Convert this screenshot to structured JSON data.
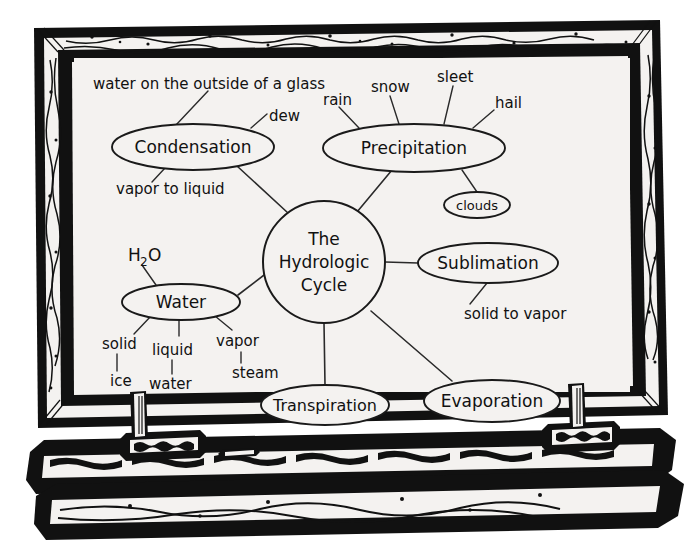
{
  "scene": {
    "kind": "chalkboard-concept-map",
    "page_background": "#ffffff",
    "board_surface": "#f4f2f0",
    "frame_color": "#111111",
    "ink_color": "#111111"
  },
  "board": {
    "ledge_items": [
      {
        "name": "eraser-left",
        "label": ""
      },
      {
        "name": "chalk-stick",
        "label": ""
      },
      {
        "name": "eraser-right",
        "label": ""
      }
    ]
  },
  "map": {
    "center": {
      "id": "hydrologic-cycle",
      "lines": [
        "The",
        "Hydrologic",
        "Cycle"
      ],
      "text": "The Hydrologic Cycle",
      "cx": 324,
      "cy": 262,
      "r": 61
    },
    "nodes": [
      {
        "id": "condensation",
        "label": "Condensation",
        "cx": 193,
        "cy": 147,
        "rx": 81,
        "ry": 23,
        "font": 17
      },
      {
        "id": "precipitation",
        "label": "Precipitation",
        "cx": 414,
        "cy": 148,
        "rx": 91,
        "ry": 24,
        "font": 17
      },
      {
        "id": "clouds",
        "label": "clouds",
        "cx": 477,
        "cy": 205,
        "rx": 33,
        "ry": 13,
        "font": 13
      },
      {
        "id": "water",
        "label": "Water",
        "cx": 181,
        "cy": 302,
        "rx": 59,
        "ry": 18,
        "font": 17
      },
      {
        "id": "sublimation",
        "label": "Sublimation",
        "cx": 488,
        "cy": 263,
        "rx": 70,
        "ry": 20,
        "font": 17
      },
      {
        "id": "transpiration",
        "label": "Transpiration",
        "cx": 325,
        "cy": 405,
        "rx": 64,
        "ry": 20,
        "font": 16
      },
      {
        "id": "evaporation",
        "label": "Evaporation",
        "cx": 492,
        "cy": 401,
        "rx": 68,
        "ry": 21,
        "font": 17
      }
    ],
    "free_labels": [
      {
        "id": "water-outside-glass",
        "text": "water on the outside of a glass",
        "x": 93,
        "y": 84,
        "font": 15,
        "anchor": "start"
      },
      {
        "id": "dew",
        "text": "dew",
        "x": 269,
        "y": 116,
        "font": 15,
        "anchor": "start"
      },
      {
        "id": "rain",
        "text": "rain",
        "x": 323,
        "y": 100,
        "font": 15,
        "anchor": "start"
      },
      {
        "id": "snow",
        "text": "snow",
        "x": 371,
        "y": 87,
        "font": 15,
        "anchor": "start"
      },
      {
        "id": "sleet",
        "text": "sleet",
        "x": 437,
        "y": 77,
        "font": 15,
        "anchor": "start"
      },
      {
        "id": "hail",
        "text": "hail",
        "x": 495,
        "y": 103,
        "font": 15,
        "anchor": "start"
      },
      {
        "id": "vapor-to-liquid",
        "text": "vapor to liquid",
        "x": 116,
        "y": 189,
        "font": 15,
        "anchor": "start"
      },
      {
        "id": "solid-to-vapor",
        "text": "solid to vapor",
        "x": 464,
        "y": 314,
        "font": 15,
        "anchor": "start"
      },
      {
        "id": "solid",
        "text": "solid",
        "x": 102,
        "y": 344,
        "font": 15,
        "anchor": "start"
      },
      {
        "id": "liquid",
        "text": "liquid",
        "x": 152,
        "y": 350,
        "font": 15,
        "anchor": "start"
      },
      {
        "id": "vapor",
        "text": "vapor",
        "x": 216,
        "y": 341,
        "font": 15,
        "anchor": "start"
      },
      {
        "id": "ice",
        "text": "ice",
        "x": 110,
        "y": 381,
        "font": 15,
        "anchor": "start"
      },
      {
        "id": "water-state",
        "text": "water",
        "x": 149,
        "y": 384,
        "font": 15,
        "anchor": "start"
      },
      {
        "id": "steam",
        "text": "steam",
        "x": 232,
        "y": 373,
        "font": 15,
        "anchor": "start"
      }
    ],
    "formula": {
      "id": "h2o",
      "base": "H",
      "sub": "2",
      "tail": "O",
      "x": 128,
      "y": 256,
      "font": 17
    },
    "edges": [
      {
        "from": "condensation",
        "to": "hydrologic-cycle"
      },
      {
        "from": "precipitation",
        "to": "hydrologic-cycle"
      },
      {
        "from": "water",
        "to": "hydrologic-cycle"
      },
      {
        "from": "sublimation",
        "to": "hydrologic-cycle"
      },
      {
        "from": "transpiration",
        "to": "hydrologic-cycle"
      },
      {
        "from": "evaporation",
        "to": "hydrologic-cycle"
      },
      {
        "from": "precipitation",
        "to": "clouds"
      },
      {
        "from": "condensation",
        "to": "water-outside-glass"
      },
      {
        "from": "condensation",
        "to": "dew"
      },
      {
        "from": "condensation",
        "to": "vapor-to-liquid"
      },
      {
        "from": "precipitation",
        "to": "rain"
      },
      {
        "from": "precipitation",
        "to": "snow"
      },
      {
        "from": "precipitation",
        "to": "sleet"
      },
      {
        "from": "precipitation",
        "to": "hail"
      },
      {
        "from": "sublimation",
        "to": "solid-to-vapor"
      },
      {
        "from": "water",
        "to": "solid"
      },
      {
        "from": "water",
        "to": "liquid"
      },
      {
        "from": "water",
        "to": "vapor"
      },
      {
        "from": "solid",
        "to": "ice"
      },
      {
        "from": "liquid",
        "to": "water-state"
      },
      {
        "from": "vapor",
        "to": "steam"
      },
      {
        "from": "h2o",
        "to": "water"
      }
    ]
  }
}
